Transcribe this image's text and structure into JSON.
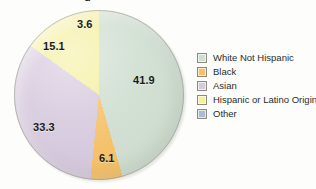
{
  "title_fragment": "g",
  "chart_data": {
    "type": "pie",
    "title": "",
    "categories": [
      "White Not Hispanic",
      "Black",
      "Asian",
      "Hispanic or Latino Origin",
      "Other"
    ],
    "values": [
      41.9,
      6.1,
      33.3,
      15.1,
      3.6
    ],
    "value_labels": [
      "41.9",
      "6.1",
      "33.3",
      "15.1",
      "3.6"
    ],
    "colors": [
      "#cfded0",
      "#f5c169",
      "#d6c9de",
      "#f5ef9e",
      "#aebcd2"
    ],
    "legend_position": "right",
    "grid": false,
    "start_angle_deg": 13,
    "direction": "clockwise",
    "units": "percent"
  },
  "legend": {
    "items": [
      {
        "label": "White Not Hispanic",
        "color": "#cfded0",
        "icon": "legend-swatch"
      },
      {
        "label": "Black",
        "color": "#f5c169",
        "icon": "legend-swatch"
      },
      {
        "label": "Asian",
        "color": "#d6c9de",
        "icon": "legend-swatch"
      },
      {
        "label": "Hispanic or Latino Origin",
        "color": "#f5ef9e",
        "icon": "legend-swatch"
      },
      {
        "label": "Other",
        "color": "#aebcd2",
        "icon": "legend-swatch"
      }
    ]
  },
  "slice_labels": [
    {
      "text": "41.9",
      "left": 133,
      "top": 74
    },
    {
      "text": "6.1",
      "left": 99,
      "top": 152
    },
    {
      "text": "33.3",
      "left": 33,
      "top": 121
    },
    {
      "text": "15.1",
      "left": 43,
      "top": 40
    },
    {
      "text": "3.6",
      "left": 77,
      "top": 18
    }
  ]
}
